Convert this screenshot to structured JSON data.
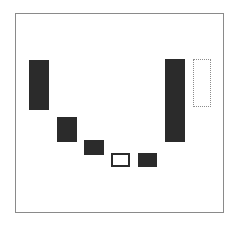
{
  "diagram": {
    "frame": {
      "x": 15,
      "y": 13,
      "w": 209,
      "h": 200,
      "border_color": "#8a8a8a"
    },
    "blocks": [
      {
        "id": "block-1",
        "style": "filled",
        "x": 29,
        "y": 60,
        "w": 20,
        "h": 50,
        "color": "#2b2b2b"
      },
      {
        "id": "block-2",
        "style": "filled",
        "x": 57,
        "y": 117,
        "w": 20,
        "h": 25,
        "color": "#2b2b2b"
      },
      {
        "id": "block-3",
        "style": "filled",
        "x": 84,
        "y": 140,
        "w": 20,
        "h": 15,
        "color": "#2b2b2b"
      },
      {
        "id": "block-4",
        "style": "outlined",
        "x": 111,
        "y": 153,
        "w": 19,
        "h": 14,
        "color": "#2b2b2b"
      },
      {
        "id": "block-5",
        "style": "filled",
        "x": 138,
        "y": 153,
        "w": 19,
        "h": 14,
        "color": "#2b2b2b"
      },
      {
        "id": "block-6",
        "style": "filled",
        "x": 165,
        "y": 59,
        "w": 20,
        "h": 83,
        "color": "#2b2b2b"
      },
      {
        "id": "block-7",
        "style": "dotted",
        "x": 193,
        "y": 59,
        "w": 18,
        "h": 48,
        "color": "#8c8c8c"
      }
    ]
  }
}
